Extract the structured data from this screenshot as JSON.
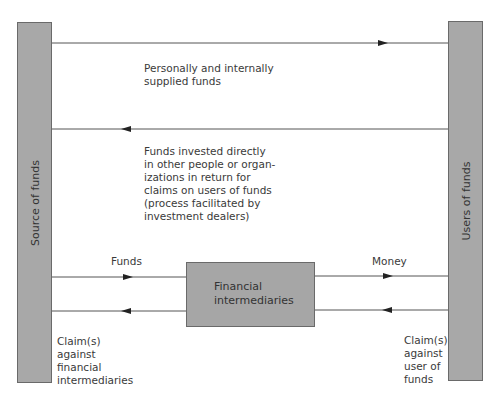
{
  "diagram": {
    "source": {
      "label": "Source of funds"
    },
    "users": {
      "label": "Users of funds"
    },
    "intermediary": {
      "label_lines": [
        "Financial",
        "intermediaries"
      ]
    },
    "direct_flow": {
      "label_lines": [
        "Personally and internally",
        "supplied funds"
      ],
      "direction": "source-to-users"
    },
    "claims_flow": {
      "label_lines": [
        "Funds invested directly",
        "in other people or organ-",
        "izations in return for",
        "claims on users of funds",
        "(process facilitated by",
        "investment dealers)"
      ],
      "direction": "users-to-source"
    },
    "funds_label": "Funds",
    "money_label": "Money",
    "claims_left_lines": [
      "Claim(s)",
      "against",
      "financial",
      "intermediaries"
    ],
    "claims_right_lines": [
      "Claim(s)",
      "against",
      "user of",
      "funds"
    ]
  }
}
